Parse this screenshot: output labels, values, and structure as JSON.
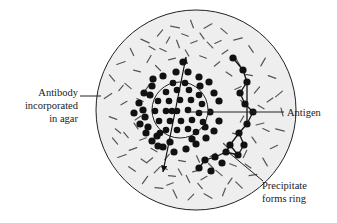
{
  "figure": {
    "background_color": "#ffffff"
  },
  "plate": {
    "name": "agar-plate",
    "fill_color": "#eeeeee",
    "stroke_color": "#222222",
    "cx": 196,
    "cy": 110,
    "r": 100
  },
  "well": {
    "name": "antigen-well",
    "fill_color": "#eeeeee",
    "stroke_color": "#222222",
    "cx": 180,
    "cy": 110,
    "r": 28
  },
  "dot_color": "#111111",
  "dash_color": "#555555",
  "labels": {
    "antibody": {
      "lines": [
        "Antibody",
        "incorporated",
        "in agar"
      ],
      "anchor_x": 78,
      "anchor_y": 96,
      "leader_from": [
        80,
        96
      ],
      "leader_to": [
        101,
        96
      ]
    },
    "antigen": {
      "lines": [
        "Antigen"
      ],
      "anchor_x": 287,
      "anchor_y": 116,
      "leader_from": [
        188,
        112
      ],
      "leader_to": [
        284,
        112
      ]
    },
    "precipitate": {
      "lines": [
        "Precipitate",
        "forms ring"
      ],
      "anchor_x": 262,
      "anchor_y": 189,
      "leader_from": [
        228,
        152
      ],
      "leader_to": [
        263,
        181
      ]
    }
  },
  "diffusion_arrow": {
    "name": "diffusion-arrow",
    "from": [
      163,
      172
    ],
    "to": [
      186,
      57
    ],
    "double_headed": true,
    "color": "#111111"
  },
  "chart_data": {
    "type": "diagram",
    "annotations": [
      "Antibody incorporated in agar",
      "Antigen",
      "Precipitate forms ring"
    ],
    "well_dot_count": 27,
    "diffuse_dot_count": 34,
    "ring_dot_count": 17,
    "agar_dash_count": 96
  },
  "well_dots": [
    [
      166,
      92
    ],
    [
      177,
      90
    ],
    [
      189,
      90
    ],
    [
      199,
      95
    ],
    [
      158,
      101
    ],
    [
      169,
      101
    ],
    [
      180,
      100
    ],
    [
      191,
      100
    ],
    [
      202,
      104
    ],
    [
      155,
      111
    ],
    [
      166,
      111
    ],
    [
      177,
      111
    ],
    [
      188,
      110
    ],
    [
      199,
      113
    ],
    [
      159,
      121
    ],
    [
      170,
      121
    ],
    [
      181,
      121
    ],
    [
      192,
      120
    ],
    [
      203,
      122
    ],
    [
      166,
      130
    ],
    [
      177,
      130
    ],
    [
      188,
      129
    ],
    [
      173,
      83
    ],
    [
      185,
      83
    ],
    [
      160,
      133
    ],
    [
      196,
      132
    ],
    [
      172,
      111
    ]
  ],
  "diffuse_dots": [
    [
      144,
      93
    ],
    [
      152,
      86
    ],
    [
      163,
      76
    ],
    [
      176,
      72
    ],
    [
      188,
      72
    ],
    [
      199,
      77
    ],
    [
      209,
      82
    ],
    [
      214,
      93
    ],
    [
      219,
      101
    ],
    [
      139,
      103
    ],
    [
      134,
      113
    ],
    [
      140,
      124
    ],
    [
      146,
      133
    ],
    [
      152,
      141
    ],
    [
      163,
      147
    ],
    [
      174,
      152
    ],
    [
      186,
      149
    ],
    [
      196,
      144
    ],
    [
      206,
      138
    ],
    [
      214,
      131
    ],
    [
      219,
      121
    ],
    [
      150,
      95
    ],
    [
      145,
      117
    ],
    [
      158,
      146
    ],
    [
      200,
      86
    ],
    [
      210,
      112
    ],
    [
      205,
      127
    ],
    [
      192,
      139
    ],
    [
      170,
      142
    ],
    [
      157,
      136
    ],
    [
      148,
      127
    ],
    [
      143,
      110
    ],
    [
      153,
      79
    ],
    [
      183,
      62
    ]
  ],
  "ring_dots": [
    [
      233,
      58
    ],
    [
      243,
      70
    ],
    [
      247,
      82
    ],
    [
      240,
      93
    ],
    [
      245,
      104
    ],
    [
      253,
      112
    ],
    [
      247,
      124
    ],
    [
      239,
      133
    ],
    [
      244,
      145
    ],
    [
      238,
      155
    ],
    [
      226,
      152
    ],
    [
      215,
      157
    ],
    [
      205,
      160
    ],
    [
      199,
      168
    ],
    [
      211,
      171
    ],
    [
      222,
      163
    ],
    [
      230,
      145
    ]
  ],
  "ring_edges": [
    [
      0,
      1
    ],
    [
      1,
      2
    ],
    [
      2,
      3
    ],
    [
      3,
      4
    ],
    [
      4,
      5
    ],
    [
      5,
      6
    ],
    [
      6,
      7
    ],
    [
      7,
      8
    ],
    [
      8,
      9
    ],
    [
      9,
      10
    ],
    [
      10,
      11
    ],
    [
      11,
      12
    ],
    [
      12,
      13
    ],
    [
      10,
      16
    ],
    [
      16,
      7
    ],
    [
      2,
      6
    ],
    [
      9,
      16
    ]
  ],
  "agar_dashes": [
    [
      113,
      118,
      8,
      20
    ],
    [
      108,
      96,
      9,
      -35
    ],
    [
      112,
      78,
      8,
      50
    ],
    [
      121,
      63,
      9,
      -20
    ],
    [
      132,
      52,
      8,
      65
    ],
    [
      145,
      41,
      9,
      25
    ],
    [
      160,
      33,
      8,
      -50
    ],
    [
      175,
      27,
      9,
      10
    ],
    [
      192,
      24,
      8,
      70
    ],
    [
      208,
      26,
      9,
      -30
    ],
    [
      224,
      31,
      8,
      40
    ],
    [
      238,
      39,
      9,
      -15
    ],
    [
      251,
      49,
      8,
      55
    ],
    [
      263,
      62,
      9,
      -60
    ],
    [
      272,
      77,
      8,
      20
    ],
    [
      279,
      94,
      9,
      -40
    ],
    [
      282,
      112,
      8,
      75
    ],
    [
      280,
      130,
      9,
      15
    ],
    [
      274,
      147,
      8,
      -25
    ],
    [
      265,
      162,
      9,
      60
    ],
    [
      253,
      175,
      8,
      -10
    ],
    [
      239,
      185,
      9,
      45
    ],
    [
      224,
      192,
      8,
      -70
    ],
    [
      208,
      196,
      9,
      30
    ],
    [
      191,
      197,
      8,
      -45
    ],
    [
      175,
      194,
      9,
      65
    ],
    [
      159,
      188,
      8,
      5
    ],
    [
      145,
      180,
      9,
      -55
    ],
    [
      132,
      169,
      8,
      35
    ],
    [
      122,
      156,
      9,
      -20
    ],
    [
      115,
      141,
      8,
      50
    ],
    [
      124,
      103,
      7,
      -30
    ],
    [
      128,
      86,
      8,
      40
    ],
    [
      137,
      71,
      7,
      15
    ],
    [
      149,
      59,
      8,
      -60
    ],
    [
      163,
      50,
      7,
      25
    ],
    [
      178,
      44,
      8,
      70
    ],
    [
      194,
      42,
      7,
      -20
    ],
    [
      210,
      45,
      8,
      45
    ],
    [
      225,
      52,
      7,
      -35
    ],
    [
      238,
      62,
      8,
      60
    ],
    [
      249,
      75,
      7,
      10
    ],
    [
      257,
      90,
      8,
      -50
    ],
    [
      261,
      107,
      7,
      30
    ],
    [
      260,
      124,
      8,
      -15
    ],
    [
      254,
      140,
      7,
      55
    ],
    [
      245,
      154,
      8,
      -65
    ],
    [
      233,
      165,
      7,
      20
    ],
    [
      219,
      173,
      8,
      40
    ],
    [
      204,
      178,
      7,
      -30
    ],
    [
      188,
      179,
      8,
      65
    ],
    [
      172,
      176,
      7,
      5
    ],
    [
      157,
      170,
      8,
      -45
    ],
    [
      144,
      161,
      7,
      35
    ],
    [
      133,
      149,
      8,
      -20
    ],
    [
      126,
      135,
      7,
      50
    ],
    [
      138,
      118,
      7,
      -35
    ],
    [
      140,
      100,
      7,
      25
    ],
    [
      147,
      88,
      7,
      -55
    ],
    [
      158,
      68,
      7,
      45
    ],
    [
      172,
      59,
      7,
      -15
    ],
    [
      187,
      53,
      7,
      60
    ],
    [
      203,
      57,
      7,
      20
    ],
    [
      217,
      64,
      7,
      -40
    ],
    [
      229,
      74,
      7,
      35
    ],
    [
      238,
      88,
      7,
      -25
    ],
    [
      243,
      103,
      7,
      50
    ],
    [
      242,
      119,
      7,
      -60
    ],
    [
      236,
      134,
      7,
      15
    ],
    [
      226,
      146,
      7,
      45
    ],
    [
      213,
      155,
      7,
      -30
    ],
    [
      198,
      159,
      7,
      65
    ],
    [
      182,
      161,
      7,
      10
    ],
    [
      167,
      157,
      7,
      -50
    ],
    [
      154,
      150,
      7,
      30
    ],
    [
      143,
      139,
      7,
      -20
    ],
    [
      136,
      126,
      7,
      55
    ],
    [
      150,
      160,
      7,
      -40
    ],
    [
      164,
      168,
      7,
      25
    ],
    [
      180,
      172,
      7,
      60
    ],
    [
      196,
      171,
      7,
      -15
    ],
    [
      211,
      166,
      7,
      45
    ],
    [
      152,
      48,
      7,
      30
    ],
    [
      168,
      40,
      7,
      -60
    ],
    [
      185,
      35,
      7,
      20
    ],
    [
      202,
      36,
      7,
      55
    ],
    [
      218,
      42,
      7,
      -25
    ],
    [
      118,
      131,
      7,
      40
    ],
    [
      121,
      88,
      7,
      -50
    ],
    [
      266,
      130,
      7,
      25
    ],
    [
      270,
      100,
      7,
      -35
    ],
    [
      200,
      186,
      7,
      50
    ],
    [
      170,
      184,
      7,
      -20
    ],
    [
      248,
      166,
      7,
      35
    ],
    [
      230,
      181,
      7,
      -55
    ]
  ]
}
